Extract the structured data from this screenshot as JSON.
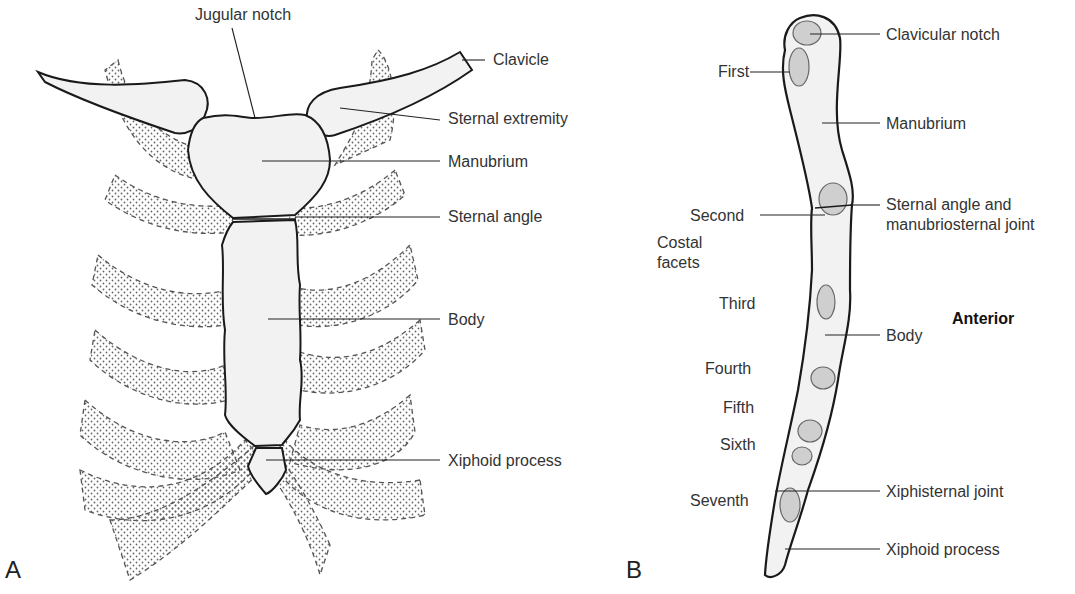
{
  "panel_a": {
    "letter": "A",
    "labels": {
      "jugular_notch": "Jugular notch",
      "clavicle": "Clavicle",
      "sternal_extremity": "Sternal extremity",
      "manubrium": "Manubrium",
      "sternal_angle": "Sternal angle",
      "body": "Body",
      "xiphoid_process": "Xiphoid process"
    }
  },
  "panel_b": {
    "letter": "B",
    "orientation": "Anterior",
    "labels": {
      "clavicular_notch": "Clavicular notch",
      "manubrium": "Manubrium",
      "sternal_angle_line1": "Sternal angle and",
      "sternal_angle_line2": "manubriosternal joint",
      "body": "Body",
      "xiphisternal_joint": "Xiphisternal joint",
      "xiphoid_process": "Xiphoid process"
    },
    "costal_facets": {
      "title_line1": "Costal",
      "title_line2": "facets",
      "items": [
        "First",
        "Second",
        "Third",
        "Fourth",
        "Fifth",
        "Sixth",
        "Seventh"
      ]
    }
  },
  "colors": {
    "bone_fill": "#f2f2f2",
    "outline": "#1a1a1a",
    "facet_fill": "#cfcfcf",
    "cartilage_dots": "#666666"
  }
}
